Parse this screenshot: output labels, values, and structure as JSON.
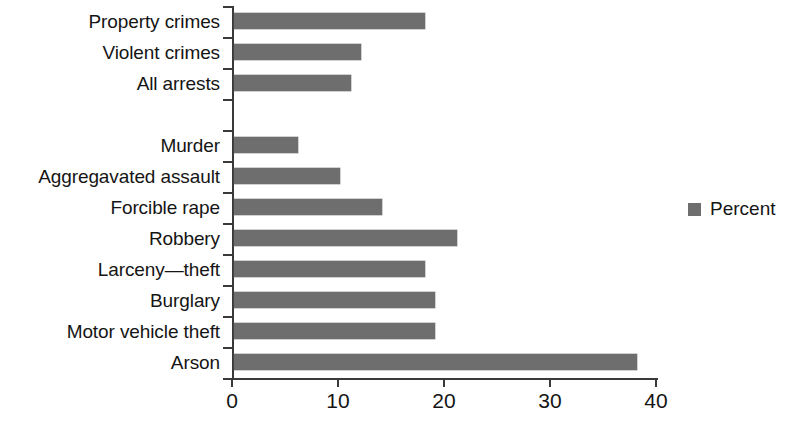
{
  "chart_data": {
    "type": "bar",
    "orientation": "horizontal",
    "title": "",
    "subtitle": "",
    "xlabel": "",
    "ylabel": "",
    "xlim": [
      0,
      40
    ],
    "xticks": [
      "0",
      "10",
      "20",
      "30",
      "40"
    ],
    "xtick_values": [
      0,
      10,
      20,
      30,
      40
    ],
    "grid": false,
    "legend_position": "right",
    "bar_color": "#6e6e6e",
    "axis_color": "#3a3a3a",
    "background_color": "#ffffff",
    "categories": [
      "Property crimes",
      "Violent crimes",
      "All arrests",
      "",
      "Murder",
      "Aggregavated assault",
      "Forcible rape",
      "Robbery",
      "Larceny—theft",
      "Burglary",
      "Motor vehicle theft",
      "Arson"
    ],
    "values": [
      18,
      12,
      11,
      null,
      6,
      10,
      14,
      21,
      18,
      19,
      19,
      38
    ],
    "series": [
      {
        "name": "Percent",
        "values": [
          18,
          12,
          11,
          null,
          6,
          10,
          14,
          21,
          18,
          19,
          19,
          38
        ]
      }
    ],
    "legend": [
      "Percent"
    ]
  },
  "legend": {
    "label": "Percent"
  }
}
